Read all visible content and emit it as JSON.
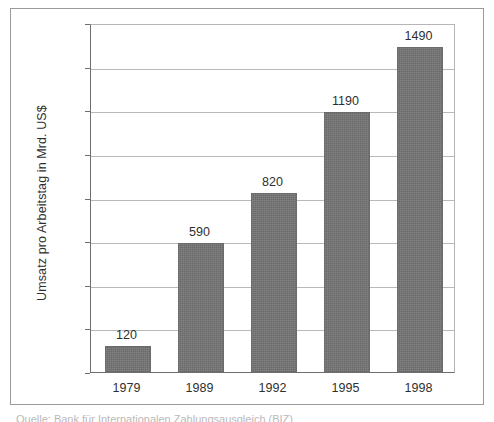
{
  "figure": {
    "caption": "Quelle: Bank für Internationalen Zahlungsausgleich (BIZ)"
  },
  "chart_data": {
    "type": "bar",
    "title": "",
    "xlabel": "",
    "ylabel": "Umsatz pro Arbeitstag in Mrd. US$",
    "categories": [
      "1979",
      "1989",
      "1992",
      "1995",
      "1998"
    ],
    "values": [
      120,
      590,
      820,
      1190,
      1490
    ],
    "value_labels": [
      "120",
      "590",
      "820",
      "1190",
      "1490"
    ],
    "ylim": [
      0,
      1600
    ],
    "ytick_labels": [
      "0",
      "200",
      "400",
      "600",
      "800",
      "1000",
      "1200",
      "1400",
      "1600"
    ],
    "ytick_values": [
      0,
      200,
      400,
      600,
      800,
      1000,
      1200,
      1400,
      1600
    ],
    "grid": true,
    "legend": "none",
    "colors": {
      "bar_fill": "#737373",
      "bar_border": "#6b6b6b",
      "gridline": "#b9b9b9",
      "axis": "#6e6e6e",
      "text": "#2f2f2f",
      "frame": "#9a9a9a",
      "background": "#ffffff"
    }
  }
}
